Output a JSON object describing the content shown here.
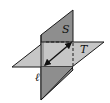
{
  "diagram": {
    "planes": [
      {
        "name": "S",
        "label": "S",
        "color": "#8c8c8c",
        "orientation": "vertical"
      },
      {
        "name": "T",
        "label": "T",
        "color": "#c4c4c4",
        "orientation": "horizontal"
      }
    ],
    "line": {
      "name": "l",
      "label": "ℓ",
      "arrows": "both"
    },
    "colors": {
      "plane_s": "#8c8c8c",
      "plane_t": "#c4c4c4",
      "stroke": "#1a1a1a",
      "background": "#ffffff"
    }
  }
}
